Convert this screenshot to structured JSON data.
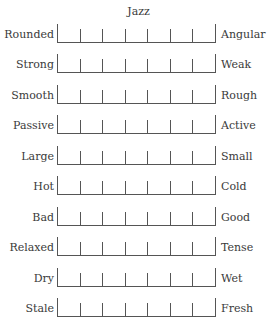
{
  "title": "Jazz",
  "scale_points": 7,
  "rows": [
    {
      "left": "Rounded",
      "right": "Angular"
    },
    {
      "left": "Strong",
      "right": "Weak"
    },
    {
      "left": "Smooth",
      "right": "Rough"
    },
    {
      "left": "Passive",
      "right": "Active"
    },
    {
      "left": "Large",
      "right": "Small"
    },
    {
      "left": "Hot",
      "right": "Cold"
    },
    {
      "left": "Bad",
      "right": "Good"
    },
    {
      "left": "Relaxed",
      "right": "Tense"
    },
    {
      "left": "Dry",
      "right": "Wet"
    },
    {
      "left": "Stale",
      "right": "Fresh"
    }
  ]
}
